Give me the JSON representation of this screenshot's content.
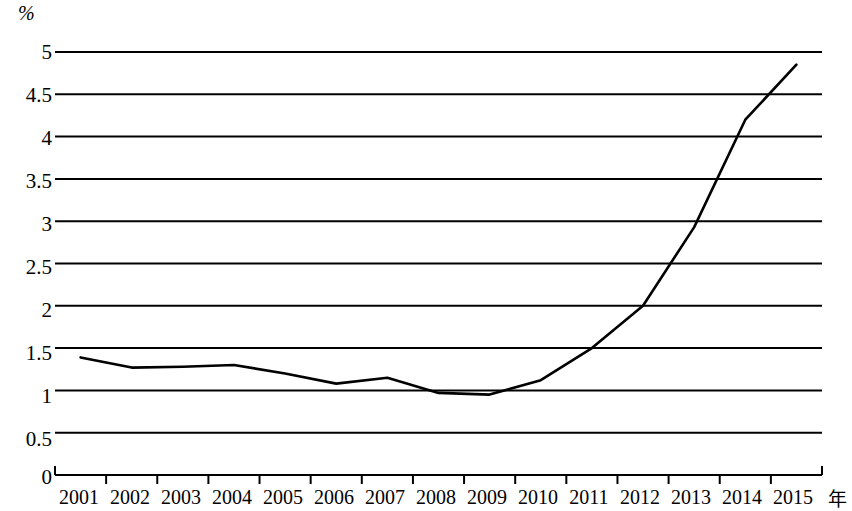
{
  "chart_data": {
    "type": "line",
    "title": "",
    "subtitle": "",
    "xlabel": "年",
    "ylabel": "%",
    "categories": [
      "2001",
      "2002",
      "2003",
      "2004",
      "2005",
      "2006",
      "2007",
      "2008",
      "2009",
      "2010",
      "2011",
      "2012",
      "2013",
      "2014",
      "2015"
    ],
    "values": [
      1.39,
      1.27,
      1.28,
      1.3,
      1.2,
      1.08,
      1.15,
      0.97,
      0.95,
      1.12,
      1.5,
      2.0,
      2.93,
      4.2,
      4.85
    ],
    "series": [
      {
        "name": "",
        "values": [
          1.39,
          1.27,
          1.28,
          1.3,
          1.2,
          1.08,
          1.15,
          0.97,
          0.95,
          1.12,
          1.5,
          2.0,
          2.93,
          4.2,
          4.85
        ]
      }
    ],
    "ylim": [
      0,
      5
    ],
    "ytick_labels": [
      "5",
      "4.5",
      "4",
      "3.5",
      "3",
      "2.5",
      "2",
      "1.5",
      "1",
      "0.5",
      "0"
    ],
    "ytick_values": [
      5,
      4.5,
      4,
      3.5,
      3,
      2.5,
      2,
      1.5,
      1,
      0.5,
      0
    ],
    "ytick_step": 0.5,
    "grid": true,
    "grid_axis": "y",
    "legend": false,
    "legend_position": "none",
    "line_color": "#000000",
    "grid_color": "#000000",
    "axis_color": "#000000",
    "background_color": "#ffffff",
    "annotations": []
  },
  "axis_titles": {
    "y_unit": "%",
    "x_unit": "年"
  }
}
